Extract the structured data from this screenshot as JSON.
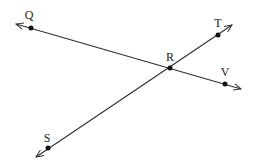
{
  "diagram": {
    "type": "geometry-intersecting-lines",
    "colors": {
      "stroke": "#333333",
      "point": "#111111",
      "background": "#ffffff"
    },
    "points": [
      {
        "name": "Q",
        "label": "Q",
        "x": 31,
        "y": 28,
        "lx": 29,
        "ly": 19
      },
      {
        "name": "R",
        "label": "R",
        "x": 170,
        "y": 68,
        "lx": 170,
        "ly": 61
      },
      {
        "name": "V",
        "label": "V",
        "x": 225,
        "y": 84,
        "lx": 225,
        "ly": 76
      },
      {
        "name": "T",
        "label": "T",
        "x": 218,
        "y": 35,
        "lx": 218,
        "ly": 27
      },
      {
        "name": "S",
        "label": "S",
        "x": 48,
        "y": 148,
        "lx": 47,
        "ly": 142
      }
    ],
    "lines": [
      {
        "name": "line-QV",
        "through": [
          "Q",
          "R",
          "V"
        ],
        "x1": 16,
        "y1": 24,
        "x2": 241,
        "y2": 89
      },
      {
        "name": "line-ST",
        "through": [
          "S",
          "R",
          "T"
        ],
        "x1": 36,
        "y1": 157,
        "x2": 232,
        "y2": 25
      }
    ]
  }
}
